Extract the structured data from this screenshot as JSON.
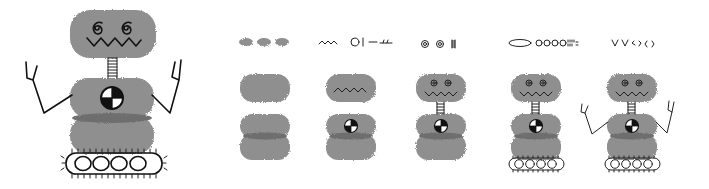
{
  "illustration": {
    "title": "Robot assembly steps",
    "background": "#ffffff",
    "body_color": "#8f8f8f",
    "seam_color": "#6e6e6e",
    "ink_color": "#111111",
    "finished_robot": {
      "parts": [
        "head",
        "spiral-eyes",
        "zigzag-mouth",
        "spring-neck",
        "chest-with-target-emblem",
        "lower-body",
        "raised-arms",
        "tank-tread"
      ]
    },
    "steps": [
      {
        "index": 1,
        "parts_row": "three gray ovals",
        "adds": "head, upper body, lower body"
      },
      {
        "index": 2,
        "parts_row": "zigzag, circle, line, dash",
        "adds": "mouth, target emblem"
      },
      {
        "index": 3,
        "parts_row": "two spirals, spring",
        "adds": "eyes, neck"
      },
      {
        "index": 4,
        "parts_row": "long oval, four circles, spikes",
        "adds": "tank tread"
      },
      {
        "index": 5,
        "parts_row": "two V shapes, two hand shapes",
        "adds": "arms and hands"
      }
    ]
  }
}
